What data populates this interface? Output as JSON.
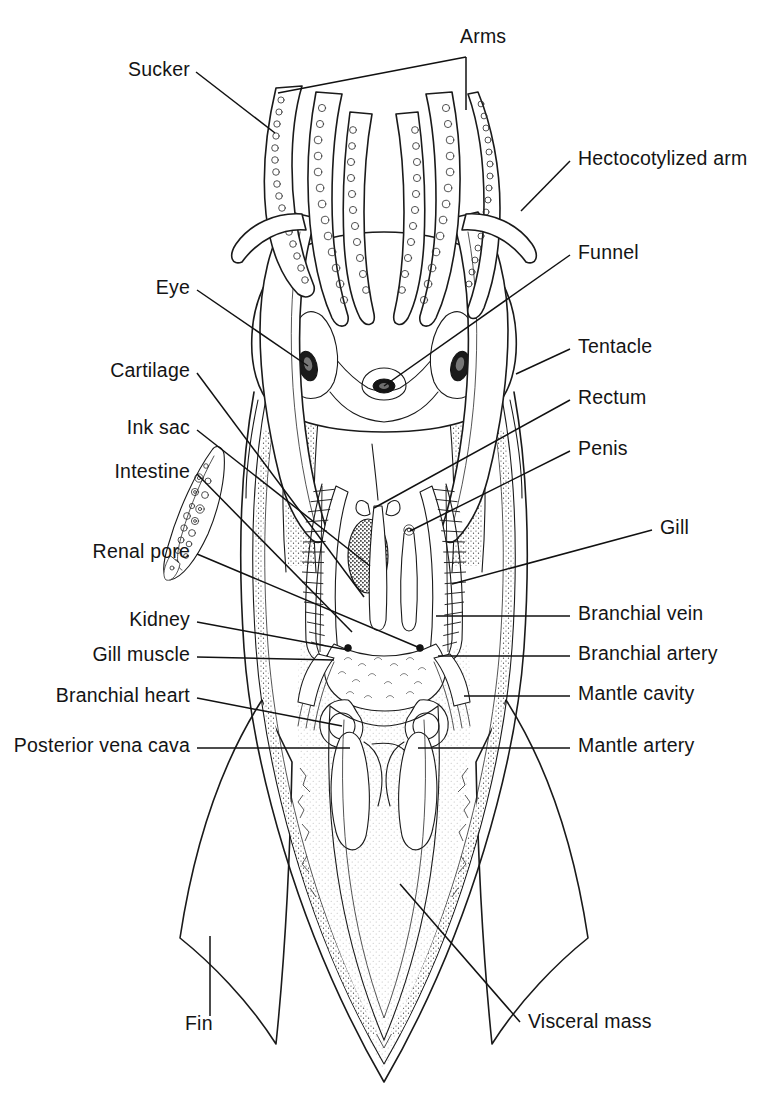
{
  "figure": {
    "background_color": "#ffffff",
    "line_color": "#1a1a1a",
    "text_color": "#141414"
  },
  "labels": {
    "top": [
      {
        "id": "arms",
        "text": "Arms",
        "side": "top",
        "x": 470,
        "y": 43
      }
    ],
    "left": [
      {
        "id": "sucker",
        "text": "Sucker",
        "x": 190,
        "y": 76
      },
      {
        "id": "eye",
        "text": "Eye",
        "x": 190,
        "y": 294
      },
      {
        "id": "cartilage",
        "text": "Cartilage",
        "x": 190,
        "y": 377
      },
      {
        "id": "ink-sac",
        "text": "Ink sac",
        "x": 190,
        "y": 434
      },
      {
        "id": "intestine",
        "text": "Intestine",
        "x": 190,
        "y": 478
      },
      {
        "id": "renal-pore",
        "text": "Renal pore",
        "x": 190,
        "y": 558
      },
      {
        "id": "kidney",
        "text": "Kidney",
        "x": 190,
        "y": 626
      },
      {
        "id": "gill-muscle",
        "text": "Gill muscle",
        "x": 190,
        "y": 661
      },
      {
        "id": "branchial-heart",
        "text": "Branchial heart",
        "x": 190,
        "y": 702
      },
      {
        "id": "posterior-vena-cava",
        "text": "Posterior vena cava",
        "x": 190,
        "y": 752
      }
    ],
    "right": [
      {
        "id": "hectocotylized-arm",
        "text": "Hectocotylized arm",
        "x": 578,
        "y": 165
      },
      {
        "id": "funnel",
        "text": "Funnel",
        "x": 578,
        "y": 259
      },
      {
        "id": "tentacle",
        "text": "Tentacle",
        "x": 578,
        "y": 353
      },
      {
        "id": "rectum",
        "text": "Rectum",
        "x": 578,
        "y": 404
      },
      {
        "id": "penis",
        "text": "Penis",
        "x": 578,
        "y": 455
      },
      {
        "id": "gill",
        "text": "Gill",
        "x": 660,
        "y": 534
      },
      {
        "id": "branchial-vein",
        "text": "Branchial vein",
        "x": 578,
        "y": 620
      },
      {
        "id": "branchial-artery",
        "text": "Branchial artery",
        "x": 578,
        "y": 660
      },
      {
        "id": "mantle-cavity",
        "text": "Mantle cavity",
        "x": 578,
        "y": 700
      },
      {
        "id": "mantle-artery",
        "text": "Mantle artery",
        "x": 578,
        "y": 752
      }
    ],
    "bottom": [
      {
        "id": "fin",
        "text": "Fin",
        "x": 185,
        "y": 1030
      },
      {
        "id": "visceral-mass",
        "text": "Visceral mass",
        "x": 528,
        "y": 1028
      }
    ]
  },
  "structures": [
    {
      "id": "arms",
      "name": "Arms"
    },
    {
      "id": "sucker",
      "name": "Sucker"
    },
    {
      "id": "hectocotylized-arm",
      "name": "Hectocotylized arm"
    },
    {
      "id": "eye",
      "name": "Eye"
    },
    {
      "id": "funnel",
      "name": "Funnel"
    },
    {
      "id": "cartilage",
      "name": "Cartilage"
    },
    {
      "id": "tentacle",
      "name": "Tentacle"
    },
    {
      "id": "ink-sac",
      "name": "Ink sac"
    },
    {
      "id": "rectum",
      "name": "Rectum"
    },
    {
      "id": "intestine",
      "name": "Intestine"
    },
    {
      "id": "penis",
      "name": "Penis"
    },
    {
      "id": "renal-pore",
      "name": "Renal pore"
    },
    {
      "id": "gill",
      "name": "Gill"
    },
    {
      "id": "kidney",
      "name": "Kidney"
    },
    {
      "id": "branchial-vein",
      "name": "Branchial vein"
    },
    {
      "id": "gill-muscle",
      "name": "Gill muscle"
    },
    {
      "id": "branchial-artery",
      "name": "Branchial artery"
    },
    {
      "id": "branchial-heart",
      "name": "Branchial heart"
    },
    {
      "id": "mantle-cavity",
      "name": "Mantle cavity"
    },
    {
      "id": "posterior-vena-cava",
      "name": "Posterior vena cava"
    },
    {
      "id": "mantle-artery",
      "name": "Mantle artery"
    },
    {
      "id": "fin",
      "name": "Fin"
    },
    {
      "id": "visceral-mass",
      "name": "Visceral mass"
    }
  ]
}
